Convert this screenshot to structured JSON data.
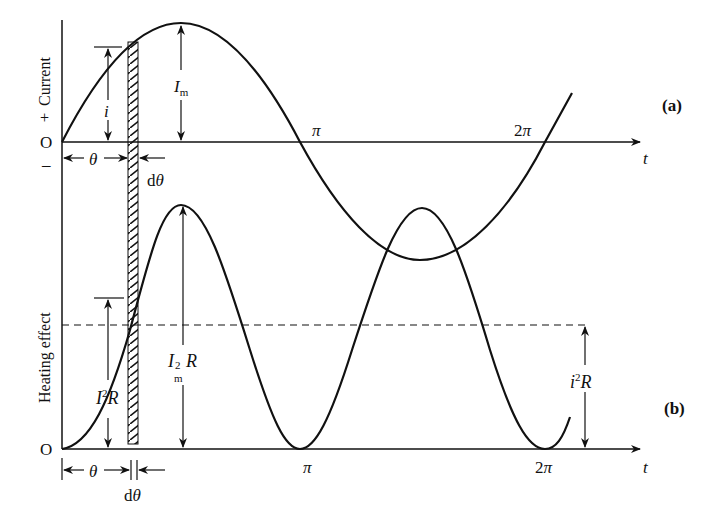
{
  "figure": {
    "panel_a": {
      "tag": "(a)",
      "y_axis_label": "Current",
      "y_plus": "+",
      "y_minus": "–",
      "origin": "O",
      "x_axis_label": "t",
      "tick_pi": "π",
      "tick_2pi": "2π",
      "label_i": "i",
      "label_Im": "I",
      "label_Im_sub": "m",
      "label_theta": "θ",
      "label_dtheta": "dθ"
    },
    "panel_b": {
      "tag": "(b)",
      "y_axis_label": "Heating effect",
      "origin": "O",
      "x_axis_label": "t",
      "tick_pi": "π",
      "tick_2pi": "2π",
      "label_I2R_base": "I",
      "label_I2R_sup": "2",
      "label_I2R_tail": "R",
      "label_Im2R_base": "I",
      "label_Im2R_sup": "2",
      "label_Im2R_sub": "m",
      "label_Im2R_tail": "R",
      "label_i2R_base": "i",
      "label_i2R_sup": "2",
      "label_i2R_tail": "R",
      "label_theta": "θ",
      "label_dtheta": "dθ"
    },
    "colors": {
      "stroke": "#111111",
      "background": "#ffffff"
    }
  }
}
